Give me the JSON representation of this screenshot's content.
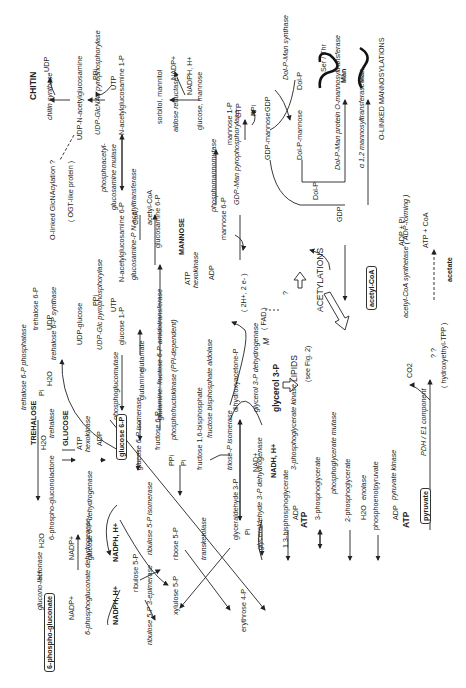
{
  "diagram": {
    "hub_metabolites": {
      "glucose_6p": "glucose 6-P",
      "glycerol_3p": "glycerol 3-P",
      "acetyl_coa": "acetyl-CoA",
      "pyruvate": "pyruvate",
      "phosphogluconate": "6-phospho-gluconate"
    },
    "chitin_branch": {
      "chitin": "CHITIN",
      "udp": "UDP",
      "chitin_synthase": "chitin synthase",
      "udp_nacetylglucosamine": "UDP-N-acetylglucosamine",
      "ppi": "PPi",
      "utp": "UTP",
      "udp_glcnac_pyro": "UDP-GlcNAc pyrophosphorylase",
      "nacetylglucosamine_1p": "N-acetylglucosamine 1-P",
      "olinked": "O-linked GlcNAcylation ?",
      "ogt": "( OGT-like protein )",
      "phosphoacetyl": "phosphoacetyl-",
      "glucosamine_mutase": "glucosamine mutase",
      "nacetylglucosamine_6p": "N-acetylglucosamine 6-P",
      "coa": "CoA",
      "acetylcoa_small": "acetyl-CoA",
      "glucosamine_6p": "glucosamine 6-P",
      "glucosamine_p_nacetyltransferase": "glucosamine-P N-acetyltransferase"
    },
    "sorbitol_branch": {
      "sorbitol_mannitol": "sorbitol, mannitol",
      "nadp": "NADP+",
      "nadph": "NADPH, H+",
      "aldose_reductase": "aldose reductase",
      "glucose_mannose": "glucose, mannose"
    },
    "mannose_branch": {
      "mannose": "MANNOSE",
      "atp": "ATP",
      "hexokinase": "hexokinase",
      "adp": "ADP",
      "mannose_6p": "mannose 6-P",
      "phosphomannomutase": "phosphomannomutase",
      "mannose_1p": "mannose 1-P",
      "gtp": "GTP",
      "ppi": "PPi",
      "gdp_man_pyro": "GDP-Man pyrophosphorylase",
      "gdp_mannose": "GDP-mannose",
      "gdp": "GDP",
      "dol_p_man_synthase": "Dol-P-Man synthase",
      "dol_p": "Dol-P",
      "dol_p_mannose": "Dol-P-mannose",
      "dol_p_man_protein": "Dol-P-Man protein O-mannosyltransferase",
      "alpha12": "α 1,2 mannosyltransferase",
      "ser_thr": "Ser / Thr",
      "man1": "Man",
      "man2": "Man",
      "olinked_mannosylations": "O-LINKED MANNOSYLATIONS",
      "gdp_out": "GDP",
      "dolp_out": "Dol-P"
    },
    "trehalose_branch": {
      "trehalose": "TREHALOSE",
      "h2o": "H2O",
      "trehalase": "trehalase",
      "glucose": "GLUCOSE",
      "atp": "ATP",
      "hexokinase": "hexokinase",
      "adp": "ADP",
      "trehalose_6p_phosphatase": "trehalose 6-P phosphatase",
      "pi": "Pi",
      "h2o2": "H2O",
      "trehalose_6p": "trehalose 6-P",
      "udp": "UDP",
      "trehalose_6p_synthase": "trehalose 6-P synthase",
      "udp_glucose": "UDP-glucose",
      "ppi": "PPi",
      "utp": "UTP",
      "udp_glc_pyro": "UDP-Glc pyrophosphorylase",
      "glucose_1p": "glucose 1-P",
      "phosphoglucomutase": "phosphoglucomutase"
    },
    "glycolysis": {
      "glucose_6p_isomerase": "glucose 6-P isomerase",
      "fructose_6p": "fructose 6-P",
      "glutamine": "glutamine",
      "glutamate": "glutamate",
      "gfat": "glutamine: fructose 6-P amidotransferase",
      "ppi": "PPi",
      "pi": "Pi",
      "pfk": "phosphofructokinase (PPi-dependent)",
      "fructose_16bp": "fructose 1,6-bisphosphate",
      "aldolase": "fructose bisphosphate aldolase",
      "triose_p_isomerase": "triose-P isomerase",
      "dhap": "dihydroxyacetone-P",
      "g3p_dehydrogenase": "glycerol 3-P dehydrogenase",
      "nad": "NAD+",
      "nadh": "NADH, H+",
      "gap": "glyceraldehyde 3-P",
      "pi2": "Pi",
      "gapdh": "glyceraldehyde 3-P dehydrogenase",
      "bpg": "1,3-bisphosphoglycerate",
      "adp1": "ADP",
      "atp1": "ATP",
      "pgk": "3-phosphoglycerate kinase",
      "pg3": "3-phosphoglycerate",
      "pgm": "phosphoglycerate mutase",
      "pg2": "2-phosphoglycerate",
      "h2o": "H2O",
      "enolase": "enolase",
      "pep": "phosphoenolpyruvate",
      "adp2": "ADP",
      "atp2": "ATP",
      "pyruvate_kinase": "pyruvate kinase"
    },
    "mitochondrial": {
      "m": "M",
      "fad": "( FAD )",
      "electrons": "( 2H+, 2 e- )",
      "question": "?",
      "lipids": "LIPIDS",
      "see_fig": "(see Fig. 2)",
      "acetylations": "ACETYLATIONS",
      "adp_pi": "ADP + Pi",
      "atp_coa": "ATP + CoA",
      "acs": "acetyl-CoA synthetase ( ADP-forming )",
      "acetate": "acetate",
      "qq": "? ?",
      "hydroxyethyl": "( hydroxyethyl-TPP )",
      "co2": "CO2",
      "pdh": "PDH / E1 component"
    },
    "ppp": {
      "h2o": "H2O",
      "hplus": "H+",
      "lactonase": "glucono-lactonase",
      "lactone": "6-phospho-gluconolactone",
      "nadp1": "NADP+",
      "g6pdh": "glucose 6-P dehydrogenase",
      "nadph1": "NADPH, H+",
      "nadp2": "NADP+",
      "pgdh": "6-phosphogluconate dehydrogenase",
      "nadph2": "NADPH, H+",
      "ribulose5p": "ribulose 5-P",
      "r5p_isomerase": "ribulose 5-P isomerase",
      "ribose5p": "ribose 5-P",
      "epimerase": "ribulose 5-P 3-epimerase",
      "xylulose5p": "xylulose 5-P",
      "transketolase": "transketolase",
      "erythrose4p": "erythrose 4-P"
    }
  }
}
